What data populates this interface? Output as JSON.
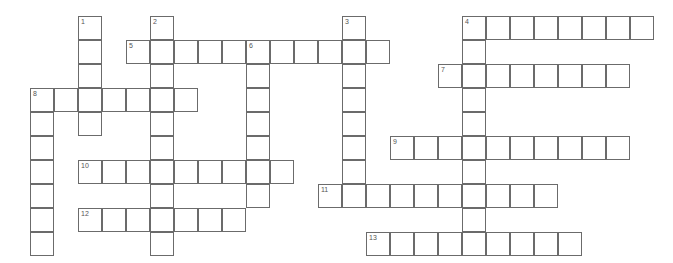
{
  "puzzle": {
    "title": "Crossword Grid",
    "type": "crossword",
    "geometry": {
      "origin_x": 30,
      "origin_y": 16,
      "cell_size": 24,
      "columns": 27,
      "rows": 10,
      "border_color": "#6b6b6b",
      "cell_background": "#ffffff",
      "page_background": "#ffffff",
      "number_color": "#555555"
    },
    "entries": [
      {
        "number": "1",
        "direction": "down",
        "col": 2,
        "row": 0,
        "length": 5
      },
      {
        "number": "2",
        "direction": "down",
        "col": 5,
        "row": 0,
        "length": 10
      },
      {
        "number": "3",
        "direction": "down",
        "col": 13,
        "row": 0,
        "length": 8
      },
      {
        "number": "4",
        "direction": "down",
        "col": 18,
        "row": 0,
        "length": 10
      },
      {
        "number": "4",
        "direction": "across",
        "col": 18,
        "row": 0,
        "length": 8
      },
      {
        "number": "5",
        "direction": "across",
        "col": 4,
        "row": 1,
        "length": 11
      },
      {
        "number": "6",
        "direction": "down",
        "col": 9,
        "row": 1,
        "length": 7
      },
      {
        "number": "7",
        "direction": "across",
        "col": 17,
        "row": 2,
        "length": 8
      },
      {
        "number": "8",
        "direction": "across",
        "col": 0,
        "row": 3,
        "length": 7
      },
      {
        "number": "8",
        "direction": "down",
        "col": 0,
        "row": 3,
        "length": 7
      },
      {
        "number": "9",
        "direction": "across",
        "col": 15,
        "row": 5,
        "length": 10
      },
      {
        "number": "10",
        "direction": "across",
        "col": 2,
        "row": 6,
        "length": 9
      },
      {
        "number": "11",
        "direction": "across",
        "col": 12,
        "row": 7,
        "length": 10
      },
      {
        "number": "12",
        "direction": "across",
        "col": 2,
        "row": 8,
        "length": 7
      },
      {
        "number": "13",
        "direction": "across",
        "col": 14,
        "row": 9,
        "length": 9
      }
    ],
    "cells": [
      {
        "col": 2,
        "row": 0,
        "number": "1"
      },
      {
        "col": 5,
        "row": 0,
        "number": "2"
      },
      {
        "col": 13,
        "row": 0,
        "number": "3"
      },
      {
        "col": 18,
        "row": 0,
        "number": "4"
      },
      {
        "col": 19,
        "row": 0,
        "number": ""
      },
      {
        "col": 20,
        "row": 0,
        "number": ""
      },
      {
        "col": 21,
        "row": 0,
        "number": ""
      },
      {
        "col": 22,
        "row": 0,
        "number": ""
      },
      {
        "col": 23,
        "row": 0,
        "number": ""
      },
      {
        "col": 24,
        "row": 0,
        "number": ""
      },
      {
        "col": 25,
        "row": 0,
        "number": ""
      },
      {
        "col": 2,
        "row": 1,
        "number": ""
      },
      {
        "col": 4,
        "row": 1,
        "number": "5"
      },
      {
        "col": 5,
        "row": 1,
        "number": ""
      },
      {
        "col": 6,
        "row": 1,
        "number": ""
      },
      {
        "col": 7,
        "row": 1,
        "number": ""
      },
      {
        "col": 8,
        "row": 1,
        "number": ""
      },
      {
        "col": 9,
        "row": 1,
        "number": "6"
      },
      {
        "col": 10,
        "row": 1,
        "number": ""
      },
      {
        "col": 11,
        "row": 1,
        "number": ""
      },
      {
        "col": 12,
        "row": 1,
        "number": ""
      },
      {
        "col": 13,
        "row": 1,
        "number": ""
      },
      {
        "col": 14,
        "row": 1,
        "number": ""
      },
      {
        "col": 18,
        "row": 1,
        "number": ""
      },
      {
        "col": 2,
        "row": 2,
        "number": ""
      },
      {
        "col": 5,
        "row": 2,
        "number": ""
      },
      {
        "col": 9,
        "row": 2,
        "number": ""
      },
      {
        "col": 13,
        "row": 2,
        "number": ""
      },
      {
        "col": 17,
        "row": 2,
        "number": "7"
      },
      {
        "col": 18,
        "row": 2,
        "number": ""
      },
      {
        "col": 19,
        "row": 2,
        "number": ""
      },
      {
        "col": 20,
        "row": 2,
        "number": ""
      },
      {
        "col": 21,
        "row": 2,
        "number": ""
      },
      {
        "col": 22,
        "row": 2,
        "number": ""
      },
      {
        "col": 23,
        "row": 2,
        "number": ""
      },
      {
        "col": 24,
        "row": 2,
        "number": ""
      },
      {
        "col": 0,
        "row": 3,
        "number": "8"
      },
      {
        "col": 1,
        "row": 3,
        "number": ""
      },
      {
        "col": 2,
        "row": 3,
        "number": ""
      },
      {
        "col": 3,
        "row": 3,
        "number": ""
      },
      {
        "col": 4,
        "row": 3,
        "number": ""
      },
      {
        "col": 5,
        "row": 3,
        "number": ""
      },
      {
        "col": 6,
        "row": 3,
        "number": ""
      },
      {
        "col": 9,
        "row": 3,
        "number": ""
      },
      {
        "col": 13,
        "row": 3,
        "number": ""
      },
      {
        "col": 18,
        "row": 3,
        "number": ""
      },
      {
        "col": 0,
        "row": 4,
        "number": ""
      },
      {
        "col": 2,
        "row": 4,
        "number": ""
      },
      {
        "col": 5,
        "row": 4,
        "number": ""
      },
      {
        "col": 9,
        "row": 4,
        "number": ""
      },
      {
        "col": 13,
        "row": 4,
        "number": ""
      },
      {
        "col": 18,
        "row": 4,
        "number": ""
      },
      {
        "col": 0,
        "row": 5,
        "number": ""
      },
      {
        "col": 5,
        "row": 5,
        "number": ""
      },
      {
        "col": 9,
        "row": 5,
        "number": ""
      },
      {
        "col": 13,
        "row": 5,
        "number": ""
      },
      {
        "col": 15,
        "row": 5,
        "number": "9"
      },
      {
        "col": 16,
        "row": 5,
        "number": ""
      },
      {
        "col": 17,
        "row": 5,
        "number": ""
      },
      {
        "col": 18,
        "row": 5,
        "number": ""
      },
      {
        "col": 19,
        "row": 5,
        "number": ""
      },
      {
        "col": 20,
        "row": 5,
        "number": ""
      },
      {
        "col": 21,
        "row": 5,
        "number": ""
      },
      {
        "col": 22,
        "row": 5,
        "number": ""
      },
      {
        "col": 23,
        "row": 5,
        "number": ""
      },
      {
        "col": 24,
        "row": 5,
        "number": ""
      },
      {
        "col": 0,
        "row": 6,
        "number": ""
      },
      {
        "col": 2,
        "row": 6,
        "number": "10"
      },
      {
        "col": 3,
        "row": 6,
        "number": ""
      },
      {
        "col": 4,
        "row": 6,
        "number": ""
      },
      {
        "col": 5,
        "row": 6,
        "number": ""
      },
      {
        "col": 6,
        "row": 6,
        "number": ""
      },
      {
        "col": 7,
        "row": 6,
        "number": ""
      },
      {
        "col": 8,
        "row": 6,
        "number": ""
      },
      {
        "col": 9,
        "row": 6,
        "number": ""
      },
      {
        "col": 10,
        "row": 6,
        "number": ""
      },
      {
        "col": 13,
        "row": 6,
        "number": ""
      },
      {
        "col": 18,
        "row": 6,
        "number": ""
      },
      {
        "col": 0,
        "row": 7,
        "number": ""
      },
      {
        "col": 5,
        "row": 7,
        "number": ""
      },
      {
        "col": 9,
        "row": 7,
        "number": ""
      },
      {
        "col": 12,
        "row": 7,
        "number": "11"
      },
      {
        "col": 13,
        "row": 7,
        "number": ""
      },
      {
        "col": 14,
        "row": 7,
        "number": ""
      },
      {
        "col": 15,
        "row": 7,
        "number": ""
      },
      {
        "col": 16,
        "row": 7,
        "number": ""
      },
      {
        "col": 17,
        "row": 7,
        "number": ""
      },
      {
        "col": 18,
        "row": 7,
        "number": ""
      },
      {
        "col": 19,
        "row": 7,
        "number": ""
      },
      {
        "col": 20,
        "row": 7,
        "number": ""
      },
      {
        "col": 21,
        "row": 7,
        "number": ""
      },
      {
        "col": 0,
        "row": 8,
        "number": ""
      },
      {
        "col": 2,
        "row": 8,
        "number": "12"
      },
      {
        "col": 3,
        "row": 8,
        "number": ""
      },
      {
        "col": 4,
        "row": 8,
        "number": ""
      },
      {
        "col": 5,
        "row": 8,
        "number": ""
      },
      {
        "col": 6,
        "row": 8,
        "number": ""
      },
      {
        "col": 7,
        "row": 8,
        "number": ""
      },
      {
        "col": 8,
        "row": 8,
        "number": ""
      },
      {
        "col": 18,
        "row": 8,
        "number": ""
      },
      {
        "col": 0,
        "row": 9,
        "number": ""
      },
      {
        "col": 5,
        "row": 9,
        "number": ""
      },
      {
        "col": 14,
        "row": 9,
        "number": "13"
      },
      {
        "col": 15,
        "row": 9,
        "number": ""
      },
      {
        "col": 16,
        "row": 9,
        "number": ""
      },
      {
        "col": 17,
        "row": 9,
        "number": ""
      },
      {
        "col": 18,
        "row": 9,
        "number": ""
      },
      {
        "col": 19,
        "row": 9,
        "number": ""
      },
      {
        "col": 20,
        "row": 9,
        "number": ""
      },
      {
        "col": 21,
        "row": 9,
        "number": ""
      },
      {
        "col": 22,
        "row": 9,
        "number": ""
      }
    ]
  }
}
